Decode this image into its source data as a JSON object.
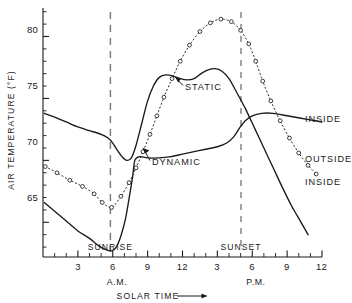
{
  "chart_data": {
    "type": "line",
    "title": "",
    "xlabel": "SOLAR TIME",
    "ylabel": "AIR TEMPERATURE (°F)",
    "xlim": [
      0,
      24
    ],
    "ylim": [
      62.2,
      82.3
    ],
    "grid": false,
    "legend_position": "inline-right-labels",
    "y_ticks": [
      65,
      70,
      75,
      80
    ],
    "y_tick_labels": [
      "65",
      "75",
      "70",
      "80"
    ],
    "y_minor_tick_step": 1,
    "x_ticks": [
      1,
      2,
      3,
      4,
      5,
      6,
      7,
      8,
      9,
      10,
      11,
      12,
      13,
      14,
      15,
      16,
      17,
      18,
      19,
      20,
      21,
      22,
      23,
      24
    ],
    "x_tick_labels": [
      {
        "hour": 3,
        "label": "3"
      },
      {
        "hour": 6,
        "label": "6"
      },
      {
        "hour": 9,
        "label": "9"
      },
      {
        "hour": 12,
        "label": "12"
      },
      {
        "hour": 15,
        "label": "3"
      },
      {
        "hour": 18,
        "label": "6"
      },
      {
        "hour": 21,
        "label": "9"
      },
      {
        "hour": 24,
        "label": "12"
      }
    ],
    "period_labels": [
      {
        "label": "A.M.",
        "hour": 6.4
      },
      {
        "label": "P.M.",
        "hour": 18.6
      }
    ],
    "annotations": [
      {
        "label": "SUNRISE",
        "hour": 5.8,
        "type": "vertical-dashed-line"
      },
      {
        "label": "SUNSET",
        "hour": 18.2,
        "type": "vertical-dashed-line"
      }
    ],
    "series": [
      {
        "name": "OUTSIDE",
        "style": "dotted-open-circles",
        "label_text": "OUTSIDE",
        "points": [
          [
            0.2,
            69.5
          ],
          [
            1.2,
            69.0
          ],
          [
            2.3,
            68.4
          ],
          [
            3.4,
            67.9
          ],
          [
            4.4,
            67.3
          ],
          [
            5.1,
            66.6
          ],
          [
            5.9,
            66.2
          ],
          [
            6.7,
            67.1
          ],
          [
            7.4,
            68.2
          ],
          [
            8.0,
            69.4
          ],
          [
            8.6,
            70.7
          ],
          [
            9.2,
            72.1
          ],
          [
            9.8,
            73.6
          ],
          [
            10.4,
            75.1
          ],
          [
            11.1,
            76.6
          ],
          [
            11.8,
            78.0
          ],
          [
            12.6,
            79.3
          ],
          [
            13.5,
            80.4
          ],
          [
            14.4,
            81.1
          ],
          [
            15.3,
            81.4
          ],
          [
            16.2,
            81.2
          ],
          [
            17.0,
            80.5
          ],
          [
            17.7,
            79.4
          ],
          [
            18.3,
            78.0
          ],
          [
            18.9,
            76.4
          ],
          [
            19.6,
            74.8
          ],
          [
            20.4,
            73.2
          ],
          [
            21.2,
            71.8
          ],
          [
            22.0,
            70.6
          ],
          [
            22.8,
            69.6
          ],
          [
            23.5,
            68.9
          ]
        ]
      },
      {
        "name": "STATIC",
        "style": "solid",
        "label_text": "STATIC",
        "points": [
          [
            0.1,
            73.8
          ],
          [
            1.0,
            73.5
          ],
          [
            2.0,
            73.1
          ],
          [
            3.0,
            72.7
          ],
          [
            4.0,
            72.4
          ],
          [
            5.0,
            72.1
          ],
          [
            5.6,
            71.8
          ],
          [
            6.0,
            71.4
          ],
          [
            6.4,
            70.8
          ],
          [
            6.8,
            70.3
          ],
          [
            7.2,
            70.0
          ],
          [
            7.6,
            70.2
          ],
          [
            8.0,
            71.2
          ],
          [
            8.5,
            73.0
          ],
          [
            9.0,
            74.8
          ],
          [
            9.5,
            76.0
          ],
          [
            10.0,
            76.7
          ],
          [
            10.6,
            76.9
          ],
          [
            11.2,
            76.8
          ],
          [
            11.8,
            76.6
          ],
          [
            12.4,
            76.5
          ],
          [
            13.0,
            76.6
          ],
          [
            13.6,
            77.0
          ],
          [
            14.2,
            77.3
          ],
          [
            14.8,
            77.4
          ],
          [
            15.4,
            77.2
          ],
          [
            16.0,
            76.6
          ],
          [
            16.6,
            75.6
          ],
          [
            17.4,
            74.2
          ],
          [
            18.2,
            72.6
          ],
          [
            19.0,
            71.0
          ],
          [
            19.8,
            69.4
          ],
          [
            20.6,
            67.8
          ],
          [
            21.4,
            66.3
          ],
          [
            22.2,
            65.0
          ],
          [
            22.8,
            64.0
          ]
        ]
      },
      {
        "name": "DYNAMIC",
        "style": "solid",
        "label_text": "DYNAMIC",
        "points": [
          [
            0.1,
            66.6
          ],
          [
            1.0,
            65.9
          ],
          [
            2.0,
            65.1
          ],
          [
            3.0,
            64.3
          ],
          [
            4.0,
            63.7
          ],
          [
            4.8,
            63.1
          ],
          [
            5.4,
            62.8
          ],
          [
            5.9,
            62.7
          ],
          [
            6.3,
            63.0
          ],
          [
            6.7,
            63.9
          ],
          [
            7.1,
            65.3
          ],
          [
            7.4,
            66.9
          ],
          [
            7.7,
            68.6
          ],
          [
            7.9,
            70.0
          ],
          [
            8.3,
            70.3
          ],
          [
            9.0,
            70.2
          ],
          [
            10.0,
            70.2
          ],
          [
            11.0,
            70.3
          ],
          [
            12.0,
            70.5
          ],
          [
            13.0,
            70.7
          ],
          [
            14.0,
            70.9
          ],
          [
            15.0,
            71.1
          ],
          [
            15.8,
            71.4
          ],
          [
            16.4,
            71.9
          ],
          [
            16.9,
            72.6
          ],
          [
            17.4,
            73.2
          ],
          [
            18.0,
            73.6
          ],
          [
            18.8,
            73.8
          ],
          [
            19.8,
            73.8
          ],
          [
            21.0,
            73.6
          ],
          [
            22.2,
            73.4
          ],
          [
            23.4,
            73.2
          ],
          [
            24.0,
            73.1
          ]
        ]
      }
    ],
    "right_labels": [
      {
        "text": "INSIDE",
        "series": "STATIC",
        "hour": 24.6,
        "value": 73.4
      },
      {
        "text": "OUTSIDE",
        "series": "OUTSIDE",
        "hour": 24.6,
        "value": 68.9
      },
      {
        "text": "INSIDE",
        "series": "DYNAMIC",
        "hour": 24.6,
        "value": 65.6
      }
    ],
    "inline_labels": [
      {
        "text": "STATIC",
        "hour": 15.2,
        "value": 76.2
      },
      {
        "text": "DYNAMIC",
        "hour": 11.6,
        "value": 68.9
      }
    ]
  },
  "axes": {
    "y_title": "AIR TEMPERATURE (°F)",
    "x_title": "SOLAR TIME",
    "x_title_arrow": "⟶",
    "y_tick_80": "80",
    "y_tick_75": "75",
    "y_tick_70": "70",
    "y_tick_65": "65"
  },
  "x_labels": {
    "am_3": "3",
    "am_6": "6",
    "am_9": "9",
    "am_12": "12",
    "pm_3": "3",
    "pm_6": "6",
    "pm_9": "9",
    "pm_12": "12",
    "am": "A.M.",
    "pm": "P.M."
  },
  "events": {
    "sunrise": "SUNRISE",
    "sunset": "SUNSET"
  },
  "curve_labels": {
    "static": "STATIC",
    "dynamic": "DYNAMIC",
    "inside_top": "INSIDE",
    "outside": "OUTSIDE",
    "inside_bottom": "INSIDE"
  },
  "colors": {
    "ink": "#1a1a1a",
    "dashed_guide": "#7d7d7d",
    "background": "#ffffff"
  }
}
